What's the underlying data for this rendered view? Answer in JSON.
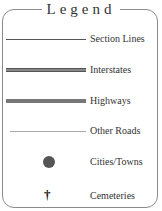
{
  "legend": {
    "title": "Legend",
    "items": [
      {
        "symbol": "section-line",
        "label": "Section Lines"
      },
      {
        "symbol": "interstate-line",
        "label": "Interstates"
      },
      {
        "symbol": "highway-line",
        "label": "Highways"
      },
      {
        "symbol": "other-road-line",
        "label": "Other Roads"
      },
      {
        "symbol": "city-dot",
        "label": "Cities/Towns"
      },
      {
        "symbol": "cemetery-cross",
        "label": "Cemeteries"
      }
    ],
    "cemetery_glyph": "†"
  },
  "colors": {
    "border": "#8a8a8a",
    "interstate": "#888888",
    "highway": "#777777",
    "other_road": "#aaaaaa",
    "city": "#555555"
  }
}
